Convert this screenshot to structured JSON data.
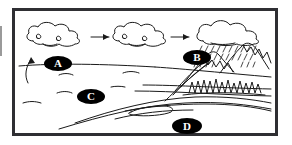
{
  "diagram": {
    "style": "black-and-white line drawing",
    "frame": {
      "border_color": "#2f2f33",
      "background_color": "#ffffff"
    },
    "ink_color": "#1a1a1a",
    "label_fill_color": "#000000",
    "label_text_color": "#ffffff",
    "labels": [
      {
        "id": "A",
        "text": "A",
        "describes": "cloud-left-condensation"
      },
      {
        "id": "B",
        "text": "B",
        "describes": "rain-cloud-precipitation"
      },
      {
        "id": "C",
        "text": "C",
        "describes": "water-body-ocean"
      },
      {
        "id": "D",
        "text": "D",
        "describes": "river-runoff"
      }
    ],
    "elements": {
      "cloud_left": "cloud-shape",
      "cloud_middle": "cloud-shape",
      "cloud_right": "rain-cloud-shape",
      "arrow_one": "right-arrow",
      "arrow_two": "right-arrow",
      "arrow_evaporation": "curved-up-arrow",
      "precipitation": "dashed-rain-streaks",
      "mountains": "mountain-range",
      "trees": "forest-line",
      "water_body": "ocean-surface-lines",
      "river": "river-channel-lines"
    }
  }
}
